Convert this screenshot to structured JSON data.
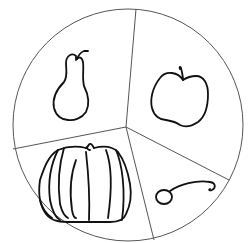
{
  "diagram": {
    "type": "circle divided into four sectors with hand-drawn fruit/vegetable sketches",
    "colors": {
      "outline": "#555555",
      "sketch": "#111111",
      "background": "#ffffff"
    },
    "sectors": [
      {
        "position": "top-left",
        "item": "pear"
      },
      {
        "position": "right",
        "item": "apple"
      },
      {
        "position": "bottom-left",
        "item": "pumpkin"
      },
      {
        "position": "bottom-right",
        "item": "cherry"
      }
    ]
  }
}
